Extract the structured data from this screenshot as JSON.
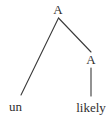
{
  "figure": {
    "kind": "syntax-tree",
    "background_color": "#ffffff",
    "stroke_color": "#3a3a3a",
    "text_color": "#2f2f2f",
    "width": 110,
    "height": 119
  },
  "tree": {
    "root": {
      "label": "A",
      "x": 58,
      "y": 9
    },
    "internal": {
      "label": "A",
      "x": 91,
      "y": 59
    },
    "leaves": [
      {
        "label": "un",
        "x": 15.5,
        "y": 106
      },
      {
        "label": "likely",
        "x": 91,
        "y": 107
      }
    ],
    "edges": [
      {
        "name": "root-to-un",
        "x1": 58.5,
        "y1": 18,
        "x2": 21,
        "y2": 95
      },
      {
        "name": "root-to-inner",
        "x1": 58.5,
        "y1": 18,
        "x2": 91,
        "y2": 52
      },
      {
        "name": "inner-to-likely",
        "x1": 91,
        "y1": 68,
        "x2": 91,
        "y2": 96
      }
    ]
  }
}
